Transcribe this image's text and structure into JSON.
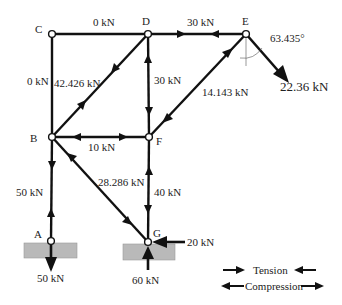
{
  "diagram": {
    "type": "truss_free_body",
    "colors": {
      "member": "#111111",
      "ground": "#b9b9b9",
      "text": "#222222"
    },
    "nodes": [
      {
        "id": "A",
        "label": "A",
        "x": 51,
        "y": 241
      },
      {
        "id": "B",
        "label": "B",
        "x": 52,
        "y": 137
      },
      {
        "id": "C",
        "label": "C",
        "x": 52,
        "y": 34
      },
      {
        "id": "D",
        "label": "D",
        "x": 148,
        "y": 34
      },
      {
        "id": "E",
        "label": "E",
        "x": 246,
        "y": 34
      },
      {
        "id": "F",
        "label": "F",
        "x": 149,
        "y": 137
      },
      {
        "id": "G",
        "label": "G",
        "x": 148,
        "y": 242
      }
    ],
    "members": [
      {
        "from": "C",
        "to": "D",
        "force": "0kN",
        "state": "zero"
      },
      {
        "from": "D",
        "to": "E",
        "force": "30kN",
        "state": "compression"
      },
      {
        "from": "C",
        "to": "B",
        "force": "0kN",
        "state": "zero"
      },
      {
        "from": "B",
        "to": "D",
        "force": "42.426kN",
        "state": "tension"
      },
      {
        "from": "D",
        "to": "F",
        "force": "30kN",
        "state": "compression"
      },
      {
        "from": "F",
        "to": "E",
        "force": "14.143kN",
        "state": "compression"
      },
      {
        "from": "B",
        "to": "F",
        "force": "10kN",
        "state": "compression"
      },
      {
        "from": "B",
        "to": "A",
        "force": "50kN",
        "state": "tension"
      },
      {
        "from": "B",
        "to": "G",
        "force": "28.286kN",
        "state": "compression"
      },
      {
        "from": "F",
        "to": "G",
        "force": "40kN",
        "state": "compression"
      }
    ],
    "loads": [
      {
        "at": "E",
        "label": "22.36 kN",
        "angle_label": "63.435°"
      },
      {
        "at": "A",
        "label": "50 kN",
        "direction": "down"
      },
      {
        "at": "G",
        "label": "20 kN",
        "direction": "left"
      },
      {
        "at": "G",
        "label": "60 kN",
        "direction": "up"
      }
    ],
    "labels": {
      "cd": "0 kN",
      "de": "30 kN",
      "cb": "0 kN",
      "bd": "42.426 kN",
      "df": "30 kN",
      "fe": "14.143 kN",
      "bf": "10 kN",
      "ba": "50 kN",
      "bg": "28.286 kN",
      "fg": "40 kN",
      "e_load": "22.36 kN",
      "e_angle": "63.435°",
      "a_load": "50 kN",
      "g_horizontal": "20 kN",
      "g_vertical": "60 kN"
    },
    "node_labels": {
      "A": "A",
      "B": "B",
      "C": "C",
      "D": "D",
      "E": "E",
      "F": "F",
      "G": "G"
    },
    "legend": {
      "tension": "Tension",
      "compression": "Compression"
    }
  }
}
